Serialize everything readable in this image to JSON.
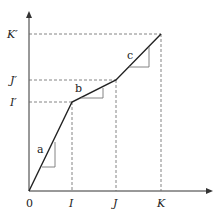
{
  "diagram": {
    "type": "piecewise-linear-function",
    "origin_label": "0",
    "x_ticks": [
      {
        "label": "I",
        "x": 72
      },
      {
        "label": "J",
        "x": 116
      },
      {
        "label": "K",
        "x": 161
      }
    ],
    "y_ticks": [
      {
        "label": "I′",
        "y": 102
      },
      {
        "label": "J′",
        "y": 80
      },
      {
        "label": "K′",
        "y": 34
      }
    ],
    "segments": [
      {
        "label": "a",
        "from": "0",
        "to": "I"
      },
      {
        "label": "b",
        "from": "I",
        "to": "J"
      },
      {
        "label": "c",
        "from": "J",
        "to": "K"
      }
    ],
    "colors": {
      "line": "#222222",
      "dashed": "#555555",
      "slope_triangle": "#777777"
    }
  }
}
